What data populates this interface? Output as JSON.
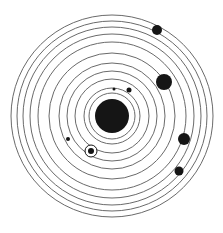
{
  "diagram": {
    "center": [
      112,
      116
    ],
    "ring_color": "#6a6a6a",
    "body_color": "#151515",
    "background": "#ffffff",
    "orbit_radii": [
      23,
      28,
      37,
      45,
      53,
      63,
      74,
      82,
      89,
      95,
      101
    ],
    "sun": {
      "name": "sun",
      "cx": 112,
      "cy": 116,
      "r": 17
    },
    "planets": [
      {
        "name": "small-moon-dot",
        "cx": 114,
        "cy": 89,
        "r": 1.5
      },
      {
        "name": "inner-planet",
        "cx": 129,
        "cy": 90,
        "r": 2.5
      },
      {
        "name": "planet-left",
        "cx": 68,
        "cy": 139,
        "r": 2
      },
      {
        "name": "highlighted-planet",
        "cx": 91,
        "cy": 151,
        "r": 3,
        "halo_r": 6
      },
      {
        "name": "giant-planet",
        "cx": 164,
        "cy": 82,
        "r": 8
      },
      {
        "name": "outer-planet-top",
        "cx": 157,
        "cy": 30,
        "r": 5
      },
      {
        "name": "planet-right",
        "cx": 184,
        "cy": 139,
        "r": 6
      },
      {
        "name": "planet-lower-right",
        "cx": 179,
        "cy": 171,
        "r": 4.5
      }
    ]
  }
}
